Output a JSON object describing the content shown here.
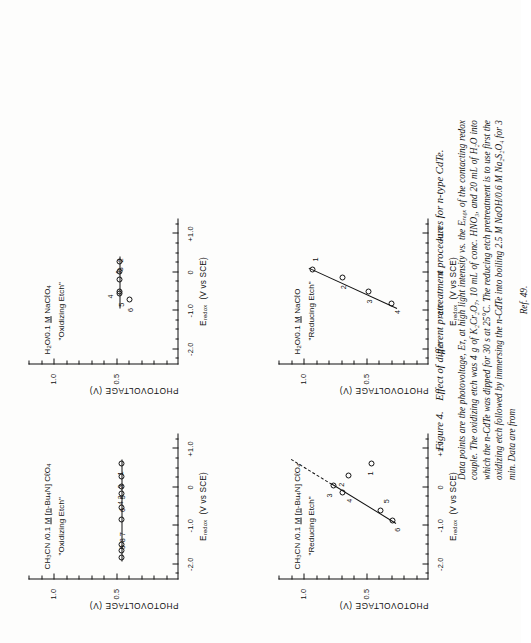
{
  "figure": {
    "number": "Figure 4.",
    "title": "Effect of different pretreatment procedures for n-type CdTe.",
    "caption_lines": [
      "Data points are the photovoltage, Eᴛ, at high light intensity vs. the Eᵣₑ₀ₓ of the contacting redox couple.",
      "The oxidizing etch was 4 g of K₂Cr₂O₇, 10 mL of conc. HNO₃, and 20 mL of H₂O into which the",
      "n-CdTe was dipped for 30 s at 25°C. The reducing etch pretreatment is to use first the oxidizing etch",
      "followed by immersing the n-CdTe into boiling 2.5 M NaOH/0.6 M Na₂S₂O₄ for 3 min. Data are from"
    ],
    "reference": "Ref. 49."
  },
  "axes": {
    "x_title_main": "E",
    "x_title_sub": "redox",
    "x_title_units": "(V vs SCE)",
    "y_title": "PHOTOVOLTAGE  (V)",
    "x_ticks": [
      {
        "value": -2.0,
        "label": "-2.0"
      },
      {
        "value": -1.0,
        "label": "-1.0"
      },
      {
        "value": 0.0,
        "label": "0"
      },
      {
        "value": 1.0,
        "label": "+1.0"
      }
    ],
    "x_minor_step": 0.25,
    "x_range": [
      -2.4,
      1.4
    ],
    "y_ticks": [
      {
        "value": 0.5,
        "label": "0.5"
      },
      {
        "value": 1.0,
        "label": "1.0"
      }
    ],
    "y_minor_step": 0.1,
    "y_range": [
      0.0,
      1.2
    ]
  },
  "chart_data": [
    {
      "id": "top-left",
      "type": "scatter",
      "title_line1_html": "CH<sub>3</sub>CN /0.1 <span class=\"u\">M</span> [<span class=\"u\">n</span>-Bu<sub>4</sub>N] CℓO<sub>4</sub>",
      "title_line2": "\"Oxidizing Etch\"",
      "xlabel": "E_redox (V vs SCE)",
      "ylabel": "PHOTOVOLTAGE (V)",
      "points": [
        {
          "label": "1",
          "x": 0.62,
          "y": 0.455,
          "lx": -10,
          "ly": -1
        },
        {
          "label": "3",
          "x": 0.28,
          "y": 0.455,
          "lx": -10,
          "ly": -1
        },
        {
          "label": "2",
          "x": 0.02,
          "y": 0.455,
          "lx": -11,
          "ly": -1
        },
        {
          "label": "4",
          "x": -0.15,
          "y": 0.455,
          "lx": -10,
          "ly": -1
        },
        {
          "label": "5",
          "x": -0.52,
          "y": 0.455,
          "lx": 10,
          "ly": 1
        },
        {
          "label": "6",
          "x": -0.85,
          "y": 0.455,
          "lx": 10,
          "ly": 1
        },
        {
          "label": "7",
          "x": -1.48,
          "y": 0.455,
          "lx": 10,
          "ly": 1
        },
        {
          "label": "8",
          "x": -1.64,
          "y": 0.455,
          "lx": 10,
          "ly": 1
        },
        {
          "label": "9",
          "x": -1.82,
          "y": 0.455,
          "lx": 10,
          "ly": 1
        }
      ],
      "fit": {
        "style": "solid",
        "x1": -1.92,
        "y1": 0.455,
        "x2": 0.72,
        "y2": 0.455
      }
    },
    {
      "id": "top-right",
      "type": "scatter",
      "title_line1_html": "H<sub>2</sub>O/0.1 <span class=\"u\">M</span> NaCℓO<sub>4</sub>",
      "title_line2": "\"Oxidizing Etch\"",
      "xlabel": "E_redox (V vs SCE)",
      "ylabel": "PHOTOVOLTAGE (V)",
      "points": [
        {
          "label": "1",
          "x": 0.27,
          "y": 0.47,
          "lx": -10,
          "ly": -1
        },
        {
          "label": "2",
          "x": 0.02,
          "y": 0.47,
          "lx": 11,
          "ly": 1
        },
        {
          "label": "3",
          "x": -0.18,
          "y": 0.47,
          "lx": 10,
          "ly": 1
        },
        {
          "label": "4",
          "x": -0.5,
          "y": 0.47,
          "lx": -5,
          "ly": -9
        },
        {
          "label": "5",
          "x": -0.56,
          "y": 0.47,
          "lx": -11,
          "ly": 2
        },
        {
          "label": "6",
          "x": -0.72,
          "y": 0.395,
          "lx": -10,
          "ly": 1
        }
      ],
      "fit": {
        "style": "solid",
        "x1": -0.95,
        "y1": 0.47,
        "x2": 0.4,
        "y2": 0.47
      }
    },
    {
      "id": "bottom-left",
      "type": "scatter",
      "title_line1_html": "CH<sub>3</sub>CN /0.1 <span class=\"u\">M</span> [<span class=\"u\">n</span>-Bu<sub>4</sub>N] CℓO<sub>4</sub>",
      "title_line2": "\"Reducing Etch\"",
      "xlabel": "E_redox (V vs SCE)",
      "ylabel": "PHOTOVOLTAGE (V)",
      "points": [
        {
          "label": "1",
          "x": 0.62,
          "y": 0.455,
          "lx": -10,
          "ly": -1
        },
        {
          "label": "2",
          "x": 0.3,
          "y": 0.64,
          "lx": -9,
          "ly": -7
        },
        {
          "label": "3",
          "x": 0.05,
          "y": 0.76,
          "lx": -10,
          "ly": -4
        },
        {
          "label": "4",
          "x": -0.14,
          "y": 0.69,
          "lx": -8,
          "ly": 7
        },
        {
          "label": "5",
          "x": -0.6,
          "y": 0.385,
          "lx": 9,
          "ly": 6
        },
        {
          "label": "6",
          "x": -0.87,
          "y": 0.29,
          "lx": -9,
          "ly": 5
        }
      ],
      "fit": {
        "style": "solid",
        "x1": -0.95,
        "y1": 0.265,
        "x2": 0.07,
        "y2": 0.775
      },
      "fit_ext": {
        "style": "dashed",
        "x1": 0.07,
        "y1": 0.775,
        "x2": 0.72,
        "y2": 1.1
      }
    },
    {
      "id": "bottom-right",
      "type": "scatter",
      "title_line1_html": "H<sub>2</sub>O/0.1 <span class=\"u\">M</span> NaCℓO",
      "title_line2": "\"Reducing Etch\"",
      "xlabel": "E_redox (V vs SCE)",
      "ylabel": "PHOTOVOLTAGE (V)",
      "points": [
        {
          "label": "1",
          "x": 0.07,
          "y": 0.93,
          "lx": 10,
          "ly": 3
        },
        {
          "label": "2",
          "x": -0.13,
          "y": 0.69,
          "lx": -10,
          "ly": 1
        },
        {
          "label": "3",
          "x": -0.5,
          "y": 0.48,
          "lx": -10,
          "ly": 1
        },
        {
          "label": "4",
          "x": -0.8,
          "y": 0.3,
          "lx": -9,
          "ly": 6
        }
      ],
      "fit": {
        "style": "solid",
        "x1": -0.93,
        "y1": 0.255,
        "x2": 0.12,
        "y2": 0.96
      }
    }
  ]
}
